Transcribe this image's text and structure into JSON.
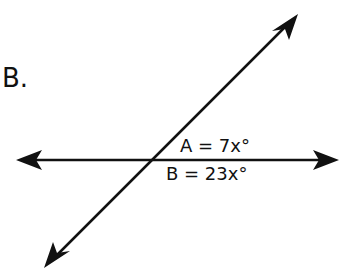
{
  "problem": {
    "label": "B."
  },
  "diagram": {
    "type": "intersecting-lines",
    "line_color": "#111111",
    "angles": [
      {
        "name": "A",
        "text": "A = 7x°"
      },
      {
        "name": "B",
        "text": "B = 23x°"
      }
    ]
  }
}
